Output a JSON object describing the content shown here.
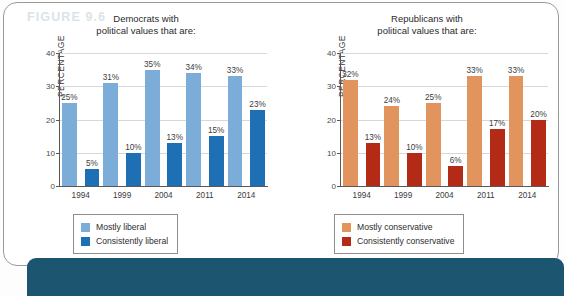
{
  "figure": {
    "label": "FIGURE 9.6",
    "banner_color": "#1b5570"
  },
  "colors": {
    "mostly_liberal": "#7cacd8",
    "consistently_liberal": "#1f6fb5",
    "mostly_conservative": "#e2945e",
    "consistently_conservative": "#b32a16",
    "gridline": "#d8d8d8",
    "axis": "#585858"
  },
  "charts": [
    {
      "id": "democrats",
      "title_line1": "Democrats with",
      "title_line2": "political values that are:",
      "ylabel": "PERCENTAGE",
      "yticks": [
        "0",
        "10",
        "20",
        "30",
        "40"
      ],
      "ymax": 40,
      "categories": [
        "1994",
        "1999",
        "2004",
        "2011",
        "2014"
      ],
      "series": [
        {
          "name": "Mostly liberal",
          "color": "#7cacd8",
          "values": [
            25,
            31,
            35,
            34,
            33
          ],
          "labels": [
            "25%",
            "31%",
            "35%",
            "34%",
            "33%"
          ]
        },
        {
          "name": "Consistently liberal",
          "color": "#1f6fb5",
          "values": [
            5,
            10,
            13,
            15,
            23
          ],
          "labels": [
            "5%",
            "10%",
            "13%",
            "15%",
            "23%"
          ]
        }
      ]
    },
    {
      "id": "republicans",
      "title_line1": "Republicans with",
      "title_line2": "political values that are:",
      "ylabel": "PERCENTAGE",
      "yticks": [
        "0",
        "10",
        "20",
        "30",
        "40"
      ],
      "ymax": 40,
      "categories": [
        "1994",
        "1999",
        "2004",
        "2011",
        "2014"
      ],
      "series": [
        {
          "name": "Mostly conservative",
          "color": "#e2945e",
          "values": [
            32,
            24,
            25,
            33,
            33
          ],
          "labels": [
            "32%",
            "24%",
            "25%",
            "33%",
            "33%"
          ]
        },
        {
          "name": "Consistently conservative",
          "color": "#b32a16",
          "values": [
            13,
            10,
            6,
            17,
            20
          ],
          "labels": [
            "13%",
            "10%",
            "6%",
            "17%",
            "20%"
          ]
        }
      ]
    }
  ],
  "chart_data": {
    "type": "bar",
    "xlabel": "",
    "ylabel": "PERCENTAGE",
    "ylim": [
      0,
      40
    ],
    "yticks": [
      0,
      10,
      20,
      30,
      40
    ],
    "grid": true,
    "legend_position": "below-plot",
    "panels": [
      {
        "panel_title": "Democrats with political values that are:",
        "categories": [
          "1994",
          "1999",
          "2004",
          "2011",
          "2014"
        ],
        "series": [
          {
            "name": "Mostly liberal",
            "values": [
              25,
              31,
              35,
              34,
              33
            ],
            "color": "#7cacd8"
          },
          {
            "name": "Consistently liberal",
            "values": [
              5,
              10,
              13,
              15,
              23
            ],
            "color": "#1f6fb5"
          }
        ]
      },
      {
        "panel_title": "Republicans with political values that are:",
        "categories": [
          "1994",
          "1999",
          "2004",
          "2011",
          "2014"
        ],
        "series": [
          {
            "name": "Mostly conservative",
            "values": [
              32,
              24,
              25,
              33,
              33
            ],
            "color": "#e2945e"
          },
          {
            "name": "Consistently conservative",
            "values": [
              13,
              10,
              6,
              17,
              20
            ],
            "color": "#b32a16"
          }
        ]
      }
    ]
  }
}
